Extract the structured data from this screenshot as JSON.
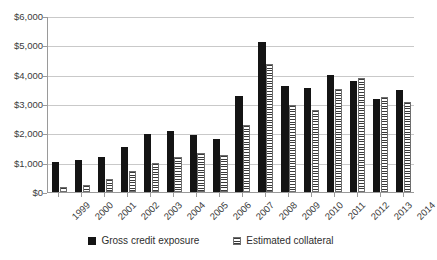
{
  "chart_data": {
    "type": "bar",
    "title": "",
    "subtitle": "",
    "xlabel": "",
    "ylabel": "",
    "categories": [
      "1999",
      "2000",
      "2001",
      "2002",
      "2003",
      "2004",
      "2005",
      "2006",
      "2007",
      "2008",
      "2009",
      "2010",
      "2011",
      "2012",
      "2013",
      "2014"
    ],
    "series": [
      {
        "name": "Gross credit exposure",
        "color": "#141414",
        "pattern": "solid",
        "values": [
          1030,
          1080,
          1180,
          1540,
          1990,
          2090,
          1930,
          1800,
          3290,
          5100,
          3620,
          3560,
          4000,
          3800,
          3180,
          3480
        ]
      },
      {
        "name": "Estimated collateral",
        "color": "#3a3a3a",
        "pattern": "horizontal-stripes",
        "values": [
          170,
          230,
          450,
          700,
          980,
          1180,
          1340,
          1270,
          2300,
          4380,
          2950,
          2800,
          3520,
          3880,
          3240,
          3080
        ]
      }
    ],
    "ylim": [
      0,
      6000
    ],
    "yticks": [
      0,
      1000,
      2000,
      3000,
      4000,
      5000,
      6000
    ],
    "ytick_labels": [
      "$0",
      "$1,000",
      "$2,000",
      "$3,000",
      "$4,000",
      "$5,000",
      "$6,000"
    ],
    "grid": true,
    "grid_axis": "y",
    "legend_position": "bottom",
    "xtick_rotation": -45
  },
  "legend": {
    "items": [
      {
        "label": "Gross credit exposure",
        "swatch": "solid-square-icon"
      },
      {
        "label": "Estimated collateral",
        "swatch": "striped-square-icon"
      }
    ]
  }
}
